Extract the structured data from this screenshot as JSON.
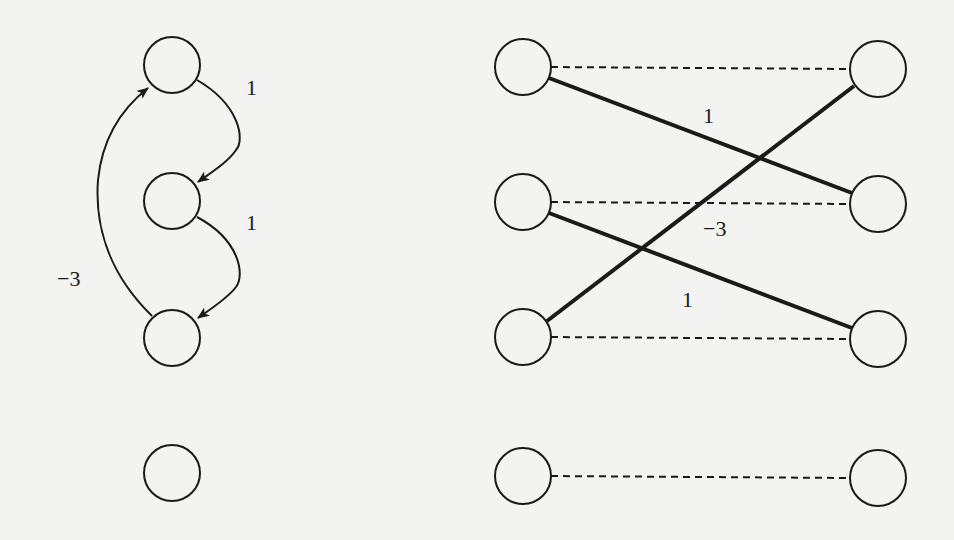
{
  "diagram": {
    "background": "#f3f3f1",
    "stroke_color": "#1a1a1a",
    "left_graph": {
      "nodes": [
        {
          "id": "a1",
          "cx": 172,
          "cy": 65
        },
        {
          "id": "a2",
          "cx": 172,
          "cy": 201
        },
        {
          "id": "a3",
          "cx": 172,
          "cy": 338
        },
        {
          "id": "a4",
          "cx": 172,
          "cy": 473
        }
      ],
      "edges": [
        {
          "from": "a1",
          "to": "a2",
          "weight": "1",
          "label_x": 246,
          "label_y": 95
        },
        {
          "from": "a2",
          "to": "a3",
          "weight": "1",
          "label_x": 246,
          "label_y": 230
        },
        {
          "from": "a3",
          "to": "a1",
          "weight": "−3",
          "label_x": 57,
          "label_y": 286
        }
      ]
    },
    "right_graph": {
      "left_nodes": [
        {
          "id": "u1",
          "cx": 523,
          "cy": 67
        },
        {
          "id": "u2",
          "cx": 523,
          "cy": 202
        },
        {
          "id": "u3",
          "cx": 523,
          "cy": 337
        },
        {
          "id": "u4",
          "cx": 523,
          "cy": 476
        }
      ],
      "right_nodes": [
        {
          "id": "v1",
          "cx": 878,
          "cy": 69
        },
        {
          "id": "v2",
          "cx": 878,
          "cy": 204
        },
        {
          "id": "v3",
          "cx": 878,
          "cy": 339
        },
        {
          "id": "v4",
          "cx": 878,
          "cy": 478
        }
      ],
      "dashed_edges": [
        {
          "from": "u1",
          "to": "v1"
        },
        {
          "from": "u2",
          "to": "v2"
        },
        {
          "from": "u3",
          "to": "v3"
        },
        {
          "from": "u4",
          "to": "v4"
        }
      ],
      "solid_edges": [
        {
          "from": "u1",
          "to": "v2",
          "weight": "1",
          "label_x": 703,
          "label_y": 123
        },
        {
          "from": "u3",
          "to": "v1",
          "weight": "−3",
          "label_x": 703,
          "label_y": 236
        },
        {
          "from": "u2",
          "to": "v3",
          "weight": "1",
          "label_x": 682,
          "label_y": 307
        }
      ]
    }
  }
}
